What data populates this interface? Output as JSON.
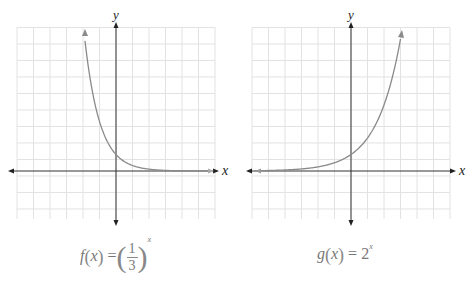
{
  "chart_data": [
    {
      "type": "line",
      "title": "f(x) = (1/3)^x",
      "function": "(1/3)^x",
      "xlabel": "x",
      "ylabel": "y",
      "grid": true,
      "xlim": [
        -6,
        6
      ],
      "ylim": [
        -3,
        9
      ],
      "x": [
        -2,
        -1.5,
        -1,
        -0.5,
        0,
        0.5,
        1,
        2,
        3,
        4,
        5,
        6
      ],
      "y": [
        9,
        5.196,
        3,
        1.732,
        1,
        0.577,
        0.333,
        0.111,
        0.037,
        0.012,
        0.004,
        0.001
      ],
      "annotations": [
        "arrow at upper-left end of curve",
        "curve approaches x-axis (asymptote y=0)"
      ]
    },
    {
      "type": "line",
      "title": "g(x) = 2^x",
      "function": "2^x",
      "xlabel": "x",
      "ylabel": "y",
      "grid": true,
      "xlim": [
        -6,
        6
      ],
      "ylim": [
        -3,
        9
      ],
      "x": [
        -6,
        -5,
        -4,
        -3,
        -2,
        -1,
        0,
        1,
        2,
        2.5,
        3
      ],
      "y": [
        0.016,
        0.031,
        0.063,
        0.125,
        0.25,
        0.5,
        1,
        2,
        4,
        5.657,
        8
      ],
      "annotations": [
        "arrow at upper-right end of curve",
        "curve approaches x-axis on the left (asymptote y=0)"
      ]
    }
  ],
  "left_graph": {
    "axis_x_label": "x",
    "axis_y_label": "y",
    "caption_lhs": "f",
    "caption_arg": "x",
    "caption_eq": "=",
    "caption_num": "1",
    "caption_den": "3",
    "caption_exp": "x"
  },
  "right_graph": {
    "axis_x_label": "x",
    "axis_y_label": "y",
    "caption_lhs": "g",
    "caption_arg": "x",
    "caption_eq": "=",
    "caption_base": "2",
    "caption_exp": "x"
  },
  "colors": {
    "grid": "#e2e2e2",
    "axis": "#333333",
    "curve": "#8a8a8a",
    "caption": "#777777"
  }
}
